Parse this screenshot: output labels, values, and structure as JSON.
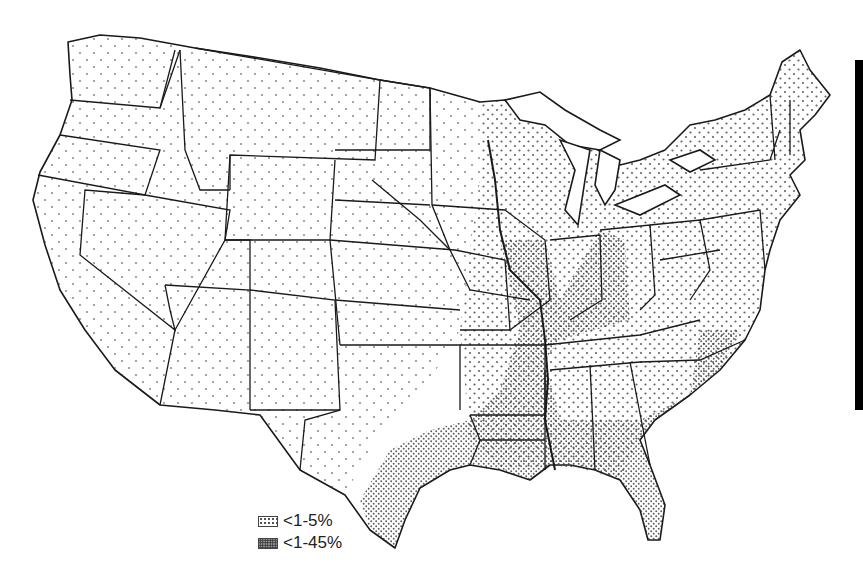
{
  "map": {
    "type": "dot-density choropleth",
    "region": "Contiguous United States",
    "colors": {
      "outline": "#1a1a1a",
      "dot": "#333333",
      "background": "#ffffff"
    }
  },
  "legend": {
    "items": [
      {
        "label": "<1-5%",
        "pattern": "sparse-dots"
      },
      {
        "label": "<1-45%",
        "pattern": "dense-dots"
      }
    ]
  }
}
